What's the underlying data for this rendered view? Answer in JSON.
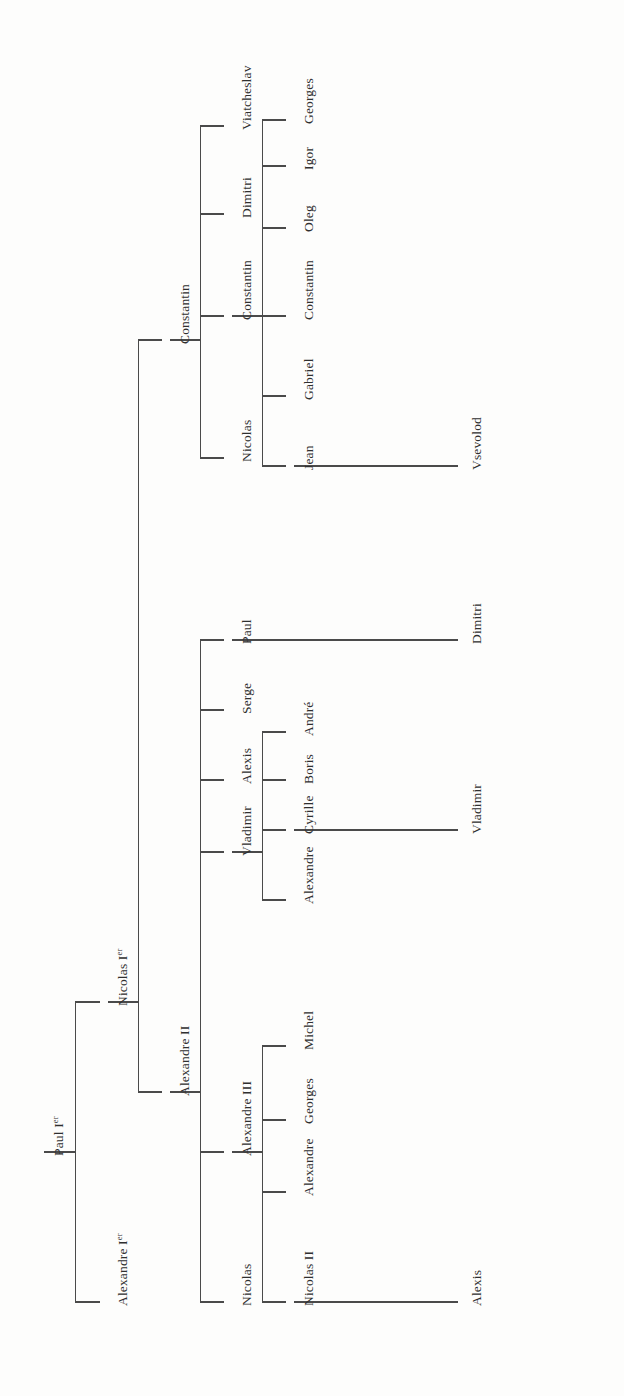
{
  "document": {
    "kind": "genealogy-tree",
    "title": "Romanov dynasty descent chart",
    "orientation": "rotated-90-ccw",
    "background_color": "#fdfdfc",
    "line_color": "#4a4a4a",
    "text_color": "#2f2f2f"
  },
  "chart_data": {
    "type": "tree",
    "root": "Paul Ier",
    "nodes": [
      {
        "id": "paul1",
        "label": "Paul I",
        "suffix": "er",
        "gen": 0,
        "x": 40,
        "y": 1152
      },
      {
        "id": "alexandre1",
        "label": "Alexandre I",
        "suffix": "er",
        "gen": 1,
        "x": 104,
        "y": 1302
      },
      {
        "id": "nicolas1",
        "label": "Nicolas I",
        "suffix": "er",
        "gen": 1,
        "x": 104,
        "y": 1002
      },
      {
        "id": "alexandre2",
        "label": "Alexandre II",
        "suffix": "",
        "gen": 2,
        "x": 166,
        "y": 1092
      },
      {
        "id": "constantin_n",
        "label": "Constantin",
        "suffix": "",
        "gen": 2,
        "x": 166,
        "y": 340
      },
      {
        "id": "a2_nicolas",
        "label": "Nicolas",
        "suffix": "",
        "gen": 3,
        "x": 228,
        "y": 1302
      },
      {
        "id": "a3",
        "label": "Alexandre III",
        "suffix": "",
        "gen": 3,
        "x": 228,
        "y": 1152
      },
      {
        "id": "vladimir",
        "label": "Vladimir",
        "suffix": "",
        "gen": 3,
        "x": 228,
        "y": 852
      },
      {
        "id": "alexis_a2",
        "label": "Alexis",
        "suffix": "",
        "gen": 3,
        "x": 228,
        "y": 780
      },
      {
        "id": "serge",
        "label": "Serge",
        "suffix": "",
        "gen": 3,
        "x": 228,
        "y": 710
      },
      {
        "id": "paul_a2",
        "label": "Paul",
        "suffix": "",
        "gen": 3,
        "x": 228,
        "y": 640
      },
      {
        "id": "c_nicolas",
        "label": "Nicolas",
        "suffix": "",
        "gen": 3,
        "x": 228,
        "y": 458
      },
      {
        "id": "c_constantin",
        "label": "Constantin",
        "suffix": "",
        "gen": 3,
        "x": 228,
        "y": 316
      },
      {
        "id": "c_dimitri",
        "label": "Dimitri",
        "suffix": "",
        "gen": 3,
        "x": 228,
        "y": 214
      },
      {
        "id": "viatcheslav",
        "label": "Viatcheslav",
        "suffix": "",
        "gen": 3,
        "x": 228,
        "y": 126
      },
      {
        "id": "nicolas2",
        "label": "Nicolas II",
        "suffix": "",
        "gen": 4,
        "x": 290,
        "y": 1302
      },
      {
        "id": "a3_alexandre",
        "label": "Alexandre",
        "suffix": "",
        "gen": 4,
        "x": 290,
        "y": 1192
      },
      {
        "id": "a3_georges",
        "label": "Georges",
        "suffix": "",
        "gen": 4,
        "x": 290,
        "y": 1120
      },
      {
        "id": "a3_michel",
        "label": "Michel",
        "suffix": "",
        "gen": 4,
        "x": 290,
        "y": 1046
      },
      {
        "id": "v_alexandre",
        "label": "Alexandre",
        "suffix": "",
        "gen": 4,
        "x": 290,
        "y": 900
      },
      {
        "id": "cyrille",
        "label": "Cyrille",
        "suffix": "",
        "gen": 4,
        "x": 290,
        "y": 830
      },
      {
        "id": "boris",
        "label": "Boris",
        "suffix": "",
        "gen": 4,
        "x": 290,
        "y": 780
      },
      {
        "id": "andre",
        "label": "André",
        "suffix": "",
        "gen": 4,
        "x": 290,
        "y": 732
      },
      {
        "id": "p_dimitri",
        "label": "Dimitri",
        "suffix": "",
        "gen": 4,
        "x": 458,
        "y": 640
      },
      {
        "id": "cc_jean",
        "label": "Jean",
        "suffix": "",
        "gen": 4,
        "x": 290,
        "y": 466
      },
      {
        "id": "cc_gabriel",
        "label": "Gabriel",
        "suffix": "",
        "gen": 4,
        "x": 290,
        "y": 396
      },
      {
        "id": "cc_constantin",
        "label": "Constantin",
        "suffix": "",
        "gen": 4,
        "x": 290,
        "y": 316
      },
      {
        "id": "cc_oleg",
        "label": "Oleg",
        "suffix": "",
        "gen": 4,
        "x": 290,
        "y": 228
      },
      {
        "id": "cc_igor",
        "label": "Igor",
        "suffix": "",
        "gen": 4,
        "x": 290,
        "y": 166
      },
      {
        "id": "cc_georges",
        "label": "Georges",
        "suffix": "",
        "gen": 4,
        "x": 290,
        "y": 120
      },
      {
        "id": "alexis_n2",
        "label": "Alexis",
        "suffix": "",
        "gen": 5,
        "x": 458,
        "y": 1302
      },
      {
        "id": "vladimir_c",
        "label": "Vladimir",
        "suffix": "",
        "gen": 5,
        "x": 458,
        "y": 830
      },
      {
        "id": "vsevolod",
        "label": "Vsevolod",
        "suffix": "",
        "gen": 5,
        "x": 458,
        "y": 466
      }
    ],
    "edges": [
      {
        "parent": "paul1",
        "child": "alexandre1"
      },
      {
        "parent": "paul1",
        "child": "nicolas1"
      },
      {
        "parent": "nicolas1",
        "child": "alexandre2"
      },
      {
        "parent": "nicolas1",
        "child": "constantin_n"
      },
      {
        "parent": "alexandre2",
        "child": "a2_nicolas"
      },
      {
        "parent": "alexandre2",
        "child": "a3"
      },
      {
        "parent": "alexandre2",
        "child": "vladimir"
      },
      {
        "parent": "alexandre2",
        "child": "alexis_a2"
      },
      {
        "parent": "alexandre2",
        "child": "serge"
      },
      {
        "parent": "alexandre2",
        "child": "paul_a2"
      },
      {
        "parent": "constantin_n",
        "child": "c_nicolas"
      },
      {
        "parent": "constantin_n",
        "child": "c_constantin"
      },
      {
        "parent": "constantin_n",
        "child": "c_dimitri"
      },
      {
        "parent": "constantin_n",
        "child": "viatcheslav"
      },
      {
        "parent": "a3",
        "child": "nicolas2"
      },
      {
        "parent": "a3",
        "child": "a3_alexandre"
      },
      {
        "parent": "a3",
        "child": "a3_georges"
      },
      {
        "parent": "a3",
        "child": "a3_michel"
      },
      {
        "parent": "vladimir",
        "child": "v_alexandre"
      },
      {
        "parent": "vladimir",
        "child": "cyrille"
      },
      {
        "parent": "vladimir",
        "child": "boris"
      },
      {
        "parent": "vladimir",
        "child": "andre"
      },
      {
        "parent": "paul_a2",
        "child": "p_dimitri"
      },
      {
        "parent": "c_constantin",
        "child": "cc_jean"
      },
      {
        "parent": "c_constantin",
        "child": "cc_gabriel"
      },
      {
        "parent": "c_constantin",
        "child": "cc_constantin"
      },
      {
        "parent": "c_constantin",
        "child": "cc_oleg"
      },
      {
        "parent": "c_constantin",
        "child": "cc_igor"
      },
      {
        "parent": "c_constantin",
        "child": "cc_georges"
      },
      {
        "parent": "nicolas2",
        "child": "alexis_n2"
      },
      {
        "parent": "cyrille",
        "child": "vladimir_c"
      },
      {
        "parent": "cc_jean",
        "child": "vsevolod"
      }
    ]
  }
}
